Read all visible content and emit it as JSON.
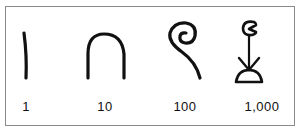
{
  "numerals": [
    {
      "value": "1",
      "glyph": "stroke-icon",
      "meaning": "single stroke"
    },
    {
      "value": "10",
      "glyph": "heel-bone-icon",
      "meaning": "heel bone / arch"
    },
    {
      "value": "100",
      "glyph": "coil-of-rope-icon",
      "meaning": "coiled rope"
    },
    {
      "value": "1,000",
      "glyph": "lotus-flower-icon",
      "meaning": "lotus plant"
    }
  ],
  "colors": {
    "ink": "#111111",
    "border": "#8a8a8a",
    "background": "#ffffff"
  }
}
